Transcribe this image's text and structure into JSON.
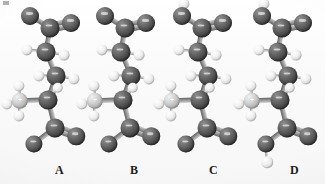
{
  "figure": {
    "caption": "",
    "background_color": "#fbfbfb",
    "width": 325,
    "height": 184
  },
  "palette": {
    "carbon": "#3a3a3a",
    "oxygen": "#3d3d3d",
    "nitrogen": "#c9c9c9",
    "hydrogen": "#efefef",
    "bond": "#b8b8b8",
    "label_color": "#1c1c1c"
  },
  "legend": {
    "element_names": {
      "carbon": "carbon",
      "oxygen": "oxygen",
      "nitrogen": "nitrogen",
      "hydrogen": "hydrogen"
    },
    "charge_marks": {
      "ammonium": "+"
    }
  },
  "molecules": [
    {
      "label": "A",
      "label_x": 55,
      "panel_x": 8,
      "description": "glutamate dianion, alpha-ammonium, both carboxylates deprotonated",
      "top_group": "carboxylate",
      "bottom_group": "carboxylate",
      "amine_group": "ammonium",
      "top_oxygen_hydrogen": false,
      "bottom_oxygen_hydrogen": false
    },
    {
      "label": "B",
      "label_x": 130,
      "panel_x": 83,
      "description": "glutamate dianion, alpha-ammonium, both carboxylates deprotonated",
      "top_group": "carboxylate",
      "bottom_group": "carboxylate",
      "amine_group": "ammonium",
      "top_oxygen_hydrogen": false,
      "bottom_oxygen_hydrogen": false
    },
    {
      "label": "C",
      "label_x": 209,
      "panel_x": 160,
      "description": "glutamate zwitterion, side-chain carboxylic acid protonated",
      "top_group": "carboxylic-acid",
      "bottom_group": "carboxylate",
      "amine_group": "ammonium",
      "top_oxygen_hydrogen": true,
      "bottom_oxygen_hydrogen": false
    },
    {
      "label": "D",
      "label_x": 290,
      "panel_x": 240,
      "description": "glutamic acid cation, both carboxylic acids protonated",
      "top_group": "carboxylic-acid",
      "bottom_group": "carboxylic-acid",
      "amine_group": "ammonium",
      "top_oxygen_hydrogen": true,
      "bottom_oxygen_hydrogen": true
    }
  ],
  "geometry": {
    "atoms": [
      {
        "id": "O1",
        "element": "oxygen",
        "x": 22,
        "y": 16,
        "r": 9.0,
        "optional": false
      },
      {
        "id": "C1",
        "element": "carbon",
        "x": 42,
        "y": 28,
        "r": 9.5,
        "optional": false
      },
      {
        "id": "O2",
        "element": "oxygen",
        "x": 63,
        "y": 23,
        "r": 9.0,
        "optional": false
      },
      {
        "id": "HO1",
        "element": "hydrogen",
        "x": 24,
        "y": 4,
        "r": 5.6,
        "optional": true,
        "slot": "top-oxygen-h"
      },
      {
        "id": "C2",
        "element": "carbon",
        "x": 38,
        "y": 52,
        "r": 9.5,
        "optional": false
      },
      {
        "id": "H2a",
        "element": "hydrogen",
        "x": 19,
        "y": 50,
        "r": 5.6,
        "optional": false
      },
      {
        "id": "H2b",
        "element": "hydrogen",
        "x": 56,
        "y": 55,
        "r": 5.4,
        "optional": false
      },
      {
        "id": "C3",
        "element": "carbon",
        "x": 48,
        "y": 76,
        "r": 9.5,
        "optional": false
      },
      {
        "id": "H3a",
        "element": "hydrogen",
        "x": 31,
        "y": 76,
        "r": 5.6,
        "optional": false
      },
      {
        "id": "H3b",
        "element": "hydrogen",
        "x": 66,
        "y": 79,
        "r": 5.6,
        "optional": false
      },
      {
        "id": "C4",
        "element": "carbon",
        "x": 40,
        "y": 100,
        "r": 9.5,
        "optional": false
      },
      {
        "id": "H4",
        "element": "hydrogen",
        "x": 50,
        "y": 88,
        "r": 5.2,
        "optional": false
      },
      {
        "id": "N",
        "element": "nitrogen",
        "x": 12,
        "y": 101,
        "r": 8.2,
        "optional": false
      },
      {
        "id": "HN1",
        "element": "hydrogen",
        "x": 11,
        "y": 86,
        "r": 5.6,
        "optional": false
      },
      {
        "id": "HN2",
        "element": "hydrogen",
        "x": 11,
        "y": 116,
        "r": 5.6,
        "optional": false
      },
      {
        "id": "HN3",
        "element": "hydrogen",
        "x": -1,
        "y": 104,
        "r": 5.6,
        "optional": false
      },
      {
        "id": "C5",
        "element": "carbon",
        "x": 47,
        "y": 128,
        "r": 9.5,
        "optional": false
      },
      {
        "id": "O3",
        "element": "oxygen",
        "x": 26,
        "y": 144,
        "r": 8.6,
        "optional": false
      },
      {
        "id": "O4",
        "element": "oxygen",
        "x": 68,
        "y": 136,
        "r": 8.8,
        "optional": false
      },
      {
        "id": "HO3",
        "element": "hydrogen",
        "x": 27,
        "y": 162,
        "r": 5.8,
        "optional": true,
        "slot": "bottom-oxygen-h"
      }
    ],
    "bonds": [
      {
        "from": "O1",
        "to": "C1",
        "order": 1,
        "optional": false
      },
      {
        "from": "C1",
        "to": "O2",
        "order": 2,
        "optional": false
      },
      {
        "from": "O1",
        "to": "HO1",
        "order": 1,
        "optional": true,
        "slot": "top-oxygen-h"
      },
      {
        "from": "C1",
        "to": "C2",
        "order": 1,
        "optional": false
      },
      {
        "from": "C2",
        "to": "H2a",
        "order": 1,
        "optional": false
      },
      {
        "from": "C2",
        "to": "H2b",
        "order": 1,
        "optional": false
      },
      {
        "from": "C2",
        "to": "C3",
        "order": 1,
        "optional": false
      },
      {
        "from": "C3",
        "to": "H3a",
        "order": 1,
        "optional": false
      },
      {
        "from": "C3",
        "to": "H3b",
        "order": 1,
        "optional": false
      },
      {
        "from": "C3",
        "to": "C4",
        "order": 1,
        "optional": false
      },
      {
        "from": "C4",
        "to": "H4",
        "order": 1,
        "optional": false
      },
      {
        "from": "C4",
        "to": "N",
        "order": 1,
        "optional": false
      },
      {
        "from": "N",
        "to": "HN1",
        "order": 1,
        "optional": false
      },
      {
        "from": "N",
        "to": "HN2",
        "order": 1,
        "optional": false
      },
      {
        "from": "N",
        "to": "HN3",
        "order": 1,
        "optional": false
      },
      {
        "from": "C4",
        "to": "C5",
        "order": 1,
        "optional": false
      },
      {
        "from": "C5",
        "to": "O3",
        "order": 1,
        "optional": false
      },
      {
        "from": "C5",
        "to": "O4",
        "order": 2,
        "optional": false
      },
      {
        "from": "O3",
        "to": "HO3",
        "order": 1,
        "optional": true,
        "slot": "bottom-oxygen-h"
      }
    ]
  }
}
